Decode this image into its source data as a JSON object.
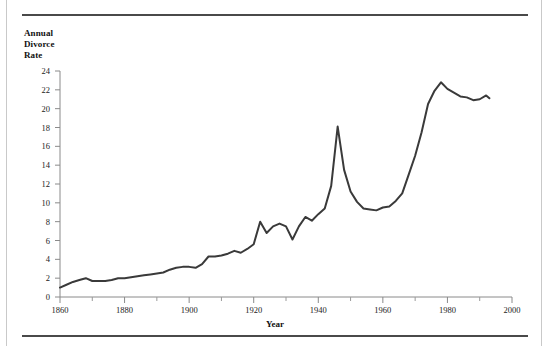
{
  "figure": {
    "y_axis_title_lines": [
      "Annual",
      "Divorce",
      "Rate"
    ],
    "x_axis_title": "Year"
  },
  "chart_data": {
    "type": "line",
    "title": "",
    "xlabel": "Year",
    "ylabel": "Annual Divorce Rate",
    "xlim": [
      1860,
      2000
    ],
    "ylim": [
      0,
      24
    ],
    "xticks": [
      1860,
      1880,
      1900,
      1920,
      1940,
      1960,
      1980,
      2000
    ],
    "xtick_labels": [
      "1860",
      "1880",
      "1900",
      "1920",
      "1940",
      "1960",
      "1980",
      "2000"
    ],
    "xminor_ticks": [
      1870,
      1890,
      1910,
      1930,
      1950,
      1970,
      1990
    ],
    "yticks": [
      0,
      2,
      4,
      6,
      8,
      10,
      12,
      14,
      16,
      18,
      20,
      22,
      24
    ],
    "ytick_labels": [
      "0",
      "2",
      "4",
      "6",
      "8",
      "10",
      "12",
      "14",
      "16",
      "18",
      "20",
      "22",
      "24"
    ],
    "grid": false,
    "legend": null,
    "line_color": "#3a3a3a",
    "line_width": 2,
    "x": [
      1860,
      1862,
      1864,
      1866,
      1868,
      1870,
      1872,
      1874,
      1876,
      1878,
      1880,
      1882,
      1884,
      1886,
      1888,
      1890,
      1892,
      1894,
      1896,
      1898,
      1900,
      1902,
      1904,
      1906,
      1908,
      1910,
      1912,
      1914,
      1916,
      1918,
      1920,
      1922,
      1924,
      1926,
      1928,
      1930,
      1932,
      1934,
      1936,
      1938,
      1940,
      1942,
      1944,
      1946,
      1948,
      1950,
      1952,
      1954,
      1956,
      1958,
      1960,
      1962,
      1964,
      1966,
      1968,
      1970,
      1972,
      1974,
      1976,
      1978,
      1980,
      1982,
      1984,
      1986,
      1988,
      1990,
      1992,
      1993
    ],
    "y": [
      1.0,
      1.3,
      1.6,
      1.8,
      2.0,
      1.7,
      1.7,
      1.7,
      1.8,
      2.0,
      2.0,
      2.1,
      2.2,
      2.3,
      2.4,
      2.5,
      2.6,
      2.9,
      3.1,
      3.2,
      3.2,
      3.1,
      3.5,
      4.3,
      4.3,
      4.4,
      4.6,
      4.9,
      4.7,
      5.1,
      5.6,
      8.0,
      6.8,
      7.5,
      7.8,
      7.5,
      6.1,
      7.5,
      8.5,
      8.1,
      8.8,
      9.4,
      11.8,
      18.1,
      13.5,
      11.2,
      10.1,
      9.4,
      9.3,
      9.2,
      9.5,
      9.6,
      10.2,
      11.0,
      13.0,
      15.0,
      17.5,
      20.5,
      21.9,
      22.8,
      22.1,
      21.7,
      21.3,
      21.2,
      20.9,
      21.0,
      21.4,
      21.1
    ]
  }
}
